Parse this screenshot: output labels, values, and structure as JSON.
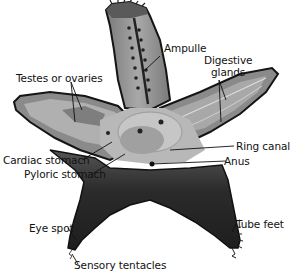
{
  "diagram": {
    "colors": {
      "background": "#ffffff",
      "outline": "#1a1a1a",
      "dorsal_skin": "#8a8a8a",
      "inner_body": "#b5b5b5",
      "organ_gray": "#9a9a9a",
      "dark_underside": "#2e2e2e",
      "leader_line": "#111111"
    },
    "labels": [
      {
        "id": "ampulle",
        "text": "Ampulle"
      },
      {
        "id": "digestive_glands_1",
        "text": "Digestive"
      },
      {
        "id": "digestive_glands_2",
        "text": "glands"
      },
      {
        "id": "testes_or_ovaries",
        "text": "Testes or ovaries"
      },
      {
        "id": "ring_canal",
        "text": "Ring canal"
      },
      {
        "id": "cardiac_stomach",
        "text": "Cardiac stomach"
      },
      {
        "id": "anus",
        "text": "Anus"
      },
      {
        "id": "pyloric_stomach",
        "text": "Pyloric stomach"
      },
      {
        "id": "eye_spot",
        "text": "Eye spot"
      },
      {
        "id": "tube_feet",
        "text": "Tube feet"
      },
      {
        "id": "sensory_tentacles",
        "text": "Sensory tentacles"
      }
    ]
  }
}
